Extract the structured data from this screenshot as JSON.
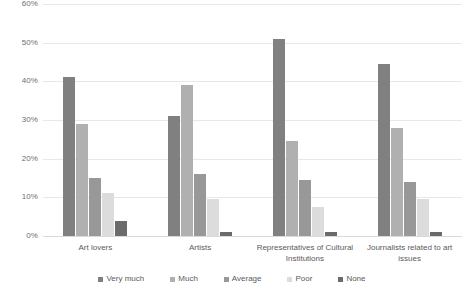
{
  "chart_data": {
    "type": "bar",
    "title": "",
    "subtitle": "",
    "xlabel": "",
    "ylabel": "",
    "ylim": [
      0,
      60
    ],
    "ytick_labels": [
      "60%",
      "50%",
      "40%",
      "30%",
      "20%",
      "10%",
      "0%"
    ],
    "ytick_values": [
      60,
      50,
      40,
      30,
      20,
      10,
      0
    ],
    "grid": true,
    "grid_axis": "y",
    "legend_position": "bottom",
    "value_suffix": "%",
    "categories": [
      "Art lovers",
      "Artists",
      "Representatives of Cultural Institutions",
      "Journalists related to art issues"
    ],
    "series": [
      {
        "name": "Very much",
        "color": "#808080",
        "values": [
          41,
          31,
          51,
          44.5
        ]
      },
      {
        "name": "Much",
        "color": "#b0b0b0",
        "values": [
          29,
          39,
          24.5,
          28
        ]
      },
      {
        "name": "Average",
        "color": "#989898",
        "values": [
          15,
          16,
          14.5,
          14
        ]
      },
      {
        "name": "Poor",
        "color": "#dcdcdc",
        "values": [
          11,
          9.5,
          7.5,
          9.5
        ]
      },
      {
        "name": "None",
        "color": "#6b6b6b",
        "values": [
          4,
          1,
          1,
          1
        ]
      }
    ]
  }
}
